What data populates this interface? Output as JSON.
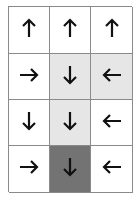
{
  "grid": {
    "rows": 4,
    "cols": 3,
    "colors": {
      "white": "#ffffff",
      "light": "#e6e6e6",
      "dark": "#737373",
      "line": "#8a8a8a",
      "arrow": "#111111"
    },
    "cells": [
      [
        {
          "dir": "up",
          "shade": "white"
        },
        {
          "dir": "up",
          "shade": "white"
        },
        {
          "dir": "up",
          "shade": "white"
        }
      ],
      [
        {
          "dir": "right",
          "shade": "white"
        },
        {
          "dir": "down",
          "shade": "light"
        },
        {
          "dir": "left",
          "shade": "light"
        }
      ],
      [
        {
          "dir": "down",
          "shade": "white"
        },
        {
          "dir": "down",
          "shade": "light"
        },
        {
          "dir": "left",
          "shade": "white"
        }
      ],
      [
        {
          "dir": "right",
          "shade": "white"
        },
        {
          "dir": "down",
          "shade": "dark"
        },
        {
          "dir": "left",
          "shade": "white"
        }
      ]
    ]
  }
}
